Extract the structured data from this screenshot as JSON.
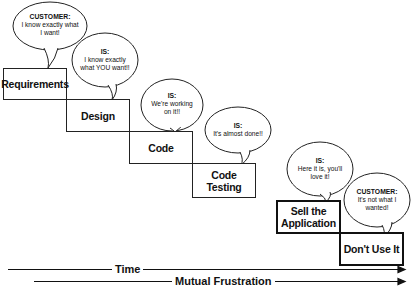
{
  "stages": [
    {
      "label": "Requirements"
    },
    {
      "label": "Design"
    },
    {
      "label": "Code"
    },
    {
      "label": "Code Testing"
    },
    {
      "label": "Sell the Application"
    },
    {
      "label": "Don't Use It"
    }
  ],
  "bubbles": [
    {
      "speaker": "CUSTOMER:",
      "text": "I know exactly what I want!"
    },
    {
      "speaker": "IS:",
      "text": "I know exactly what YOU want!!"
    },
    {
      "speaker": "IS:",
      "text": "We're working on it!!"
    },
    {
      "speaker": "IS:",
      "text": "It's almost done!!"
    },
    {
      "speaker": "IS:",
      "text": "Here it is, you'll love it!"
    },
    {
      "speaker": "CUSTOMER:",
      "text": "It's not what I wanted!"
    }
  ],
  "axes": {
    "time": "Time",
    "frustration": "Mutual Frustration"
  }
}
